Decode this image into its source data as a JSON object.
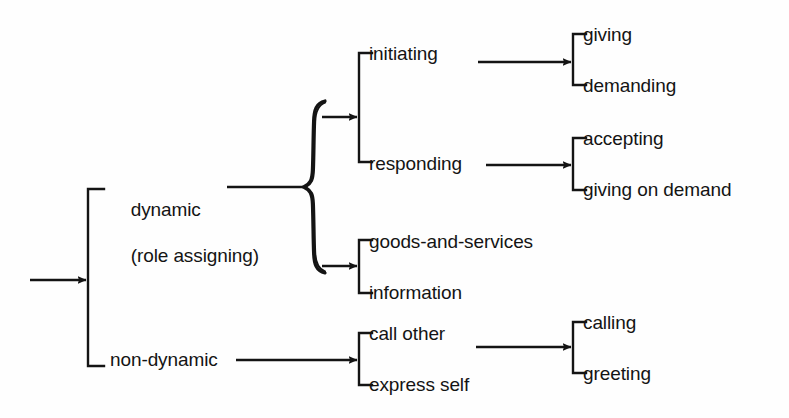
{
  "diagram": {
    "type": "tree",
    "background_color": "#fefefe",
    "stroke_color": "#141414",
    "root": {
      "entry_arrow": true
    },
    "nodes": {
      "dynamic_line1": "dynamic",
      "dynamic_line2": "(role assigning)",
      "non_dynamic": "non-dynamic",
      "initiating": "initiating",
      "responding": "responding",
      "goods_and_services": "goods-and-services",
      "information": "information",
      "call_other": "call other",
      "express_self": "express self",
      "giving": "giving",
      "demanding": "demanding",
      "accepting": "accepting",
      "giving_on_demand": "giving on demand",
      "calling": "calling",
      "greeting": "greeting"
    },
    "levels": [
      {
        "name": "level-1",
        "items": [
          "dynamic",
          "non-dynamic"
        ]
      },
      {
        "name": "level-2",
        "items": [
          "initiating",
          "responding",
          "goods-and-services",
          "information",
          "call other",
          "express self"
        ]
      },
      {
        "name": "level-3",
        "items": [
          "giving",
          "demanding",
          "accepting",
          "giving on demand",
          "calling",
          "greeting"
        ]
      }
    ],
    "icons": {
      "arrow": "arrow-right-icon",
      "bracket": "square-bracket-icon",
      "brace": "curly-brace-icon"
    }
  }
}
